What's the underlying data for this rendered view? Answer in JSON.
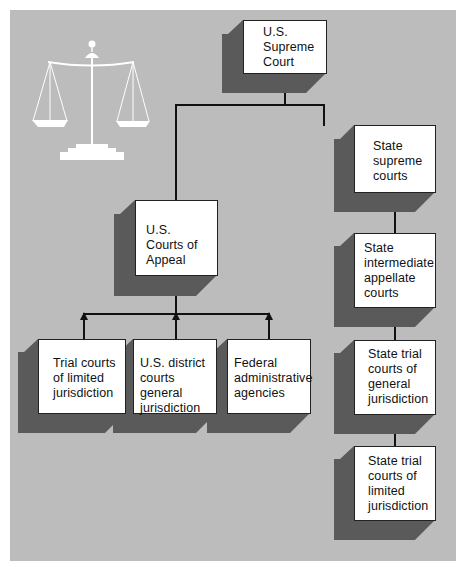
{
  "diagram": {
    "type": "hierarchy",
    "icon": "scales-of-justice-icon",
    "colors": {
      "background": "#bcbcbc",
      "box_fill": "#ffffff",
      "box_shadow": "#5a5a5a",
      "lines": "#111111"
    },
    "nodes": {
      "supreme_court": "U.S. Supreme Court",
      "courts_of_appeal": "U.S. Courts of Appeal",
      "trial_limited": "Trial courts of limited jurisdiction",
      "district_courts": "U.S. district courts general jurisdiction",
      "federal_agencies": "Federal administrative agencies",
      "state_supreme": "State supreme courts",
      "state_intermediate": "State intermediate appellate courts",
      "state_trial_general": "State trial courts of general jurisdiction",
      "state_trial_limited": "State trial courts of limited jurisdiction"
    },
    "edges": [
      {
        "from": "courts_of_appeal",
        "to": "supreme_court"
      },
      {
        "from": "state_supreme",
        "to": "supreme_court"
      },
      {
        "from": "trial_limited",
        "to": "courts_of_appeal"
      },
      {
        "from": "district_courts",
        "to": "courts_of_appeal"
      },
      {
        "from": "federal_agencies",
        "to": "courts_of_appeal"
      },
      {
        "from": "state_intermediate",
        "to": "state_supreme"
      },
      {
        "from": "state_trial_general",
        "to": "state_intermediate"
      },
      {
        "from": "state_trial_limited",
        "to": "state_trial_general"
      }
    ]
  }
}
